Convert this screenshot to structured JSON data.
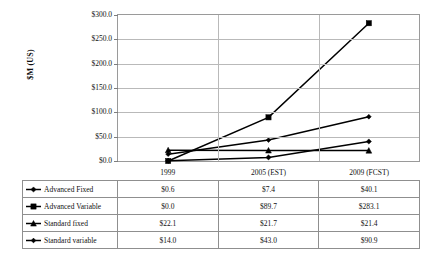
{
  "chart_data": {
    "type": "line",
    "title": "",
    "xlabel": "",
    "ylabel": "$M (US)",
    "categories": [
      "1999",
      "2005 (EST)",
      "2009 (FCST)"
    ],
    "ylim": [
      0,
      300
    ],
    "ytick_labels": [
      "$300.0",
      "$250.0",
      "$200.0",
      "$150.0",
      "$100.0",
      "$50.0",
      "$0.0"
    ],
    "ytick_values": [
      300,
      250,
      200,
      150,
      100,
      50,
      0
    ],
    "grid": true,
    "legend_position": "data-table-below",
    "series": [
      {
        "name": "Advanced Fixed",
        "values": [
          0.6,
          7.4,
          40.1
        ],
        "labels": [
          "$0.6",
          "$7.4",
          "$40.1"
        ],
        "color": "#000000",
        "marker": "diamond"
      },
      {
        "name": "Advanced Variable",
        "values": [
          0.0,
          89.7,
          283.1
        ],
        "labels": [
          "$0.0",
          "$89.7",
          "$283.1"
        ],
        "color": "#000000",
        "marker": "square"
      },
      {
        "name": "Standard fixed",
        "values": [
          22.1,
          21.7,
          21.4
        ],
        "labels": [
          "$22.1",
          "$21.7",
          "$21.4"
        ],
        "color": "#000000",
        "marker": "triangle"
      },
      {
        "name": "Standard variable",
        "values": [
          14.0,
          43.0,
          90.9
        ],
        "labels": [
          "$14.0",
          "$43.0",
          "$90.9"
        ],
        "color": "#000000",
        "marker": "cross"
      }
    ]
  }
}
